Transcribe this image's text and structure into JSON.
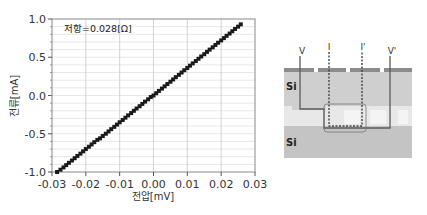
{
  "chart_data": {
    "type": "scatter",
    "title": "",
    "xlabel": "전압[mV]",
    "ylabel": "전류[mA]",
    "xlim": [
      -0.03,
      0.03
    ],
    "ylim": [
      -1.0,
      1.0
    ],
    "xticks": [
      "-0.03",
      "-0.02",
      "-0.01",
      "0.00",
      "0.01",
      "0.02",
      "0.03"
    ],
    "yticks": [
      "1.0",
      "0.5",
      "0.0",
      "-0.5",
      "-1.0"
    ],
    "grid": true,
    "annotation": "저항=0.028[Ω]",
    "marker_color": "#1a1a1a",
    "series": [
      {
        "name": "I-V",
        "x": [
          -0.0285,
          -0.0275,
          -0.0266,
          -0.0258,
          -0.025,
          -0.0241,
          -0.0233,
          -0.0225,
          -0.0216,
          -0.0208,
          -0.02,
          -0.0191,
          -0.0183,
          -0.0175,
          -0.0166,
          -0.0158,
          -0.015,
          -0.0141,
          -0.0133,
          -0.0125,
          -0.0116,
          -0.0108,
          -0.01,
          -0.0091,
          -0.0083,
          -0.0075,
          -0.0066,
          -0.0058,
          -0.005,
          -0.0041,
          -0.0033,
          -0.0025,
          -0.0016,
          -0.0008,
          0.0,
          0.0008,
          0.0016,
          0.0025,
          0.0033,
          0.0041,
          0.005,
          0.0058,
          0.0066,
          0.0075,
          0.0083,
          0.0091,
          0.01,
          0.0108,
          0.0116,
          0.0125,
          0.0133,
          0.0141,
          0.015,
          0.0158,
          0.0166,
          0.0175,
          0.0183,
          0.0191,
          0.02,
          0.0208,
          0.0216,
          0.0225,
          0.0233,
          0.0241,
          0.025,
          0.0258
        ],
        "y": [
          -1.0,
          -0.97,
          -0.94,
          -0.91,
          -0.88,
          -0.85,
          -0.82,
          -0.79,
          -0.76,
          -0.73,
          -0.7,
          -0.67,
          -0.64,
          -0.61,
          -0.58,
          -0.56,
          -0.53,
          -0.5,
          -0.47,
          -0.44,
          -0.41,
          -0.38,
          -0.35,
          -0.32,
          -0.29,
          -0.26,
          -0.23,
          -0.2,
          -0.17,
          -0.14,
          -0.11,
          -0.08,
          -0.05,
          -0.02,
          0.0,
          0.03,
          0.06,
          0.09,
          0.12,
          0.15,
          0.18,
          0.21,
          0.24,
          0.27,
          0.3,
          0.33,
          0.36,
          0.39,
          0.42,
          0.45,
          0.48,
          0.51,
          0.54,
          0.57,
          0.6,
          0.63,
          0.66,
          0.69,
          0.72,
          0.75,
          0.78,
          0.81,
          0.84,
          0.87,
          0.9,
          0.93
        ]
      }
    ]
  },
  "diagram": {
    "labels": {
      "v_left": "V",
      "i_left": "I",
      "i_right": "I'",
      "v_right": "V'",
      "si_top": "Si",
      "si_bottom": "Si"
    },
    "colors": {
      "si_fill": "#c9c9c9",
      "oxide_fill": "#e6e6e6",
      "surface_line": "#8a8a8a",
      "wire": "#555555",
      "current_path": "#555555"
    }
  }
}
